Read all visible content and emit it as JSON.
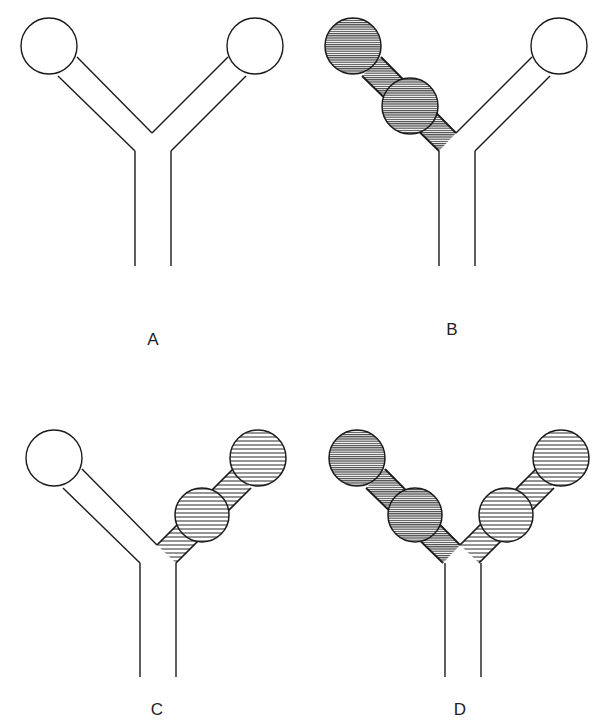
{
  "figure": {
    "colors": {
      "stroke": "#1a1a1a",
      "dense_hatch": "#3a3a3a",
      "sparse_hatch": "#2a2a2a",
      "background": "#ffffff"
    },
    "panels": [
      {
        "id": "A",
        "label": "A",
        "left_arm": "empty",
        "right_arm": "empty",
        "left_circles": 1,
        "right_circles": 1
      },
      {
        "id": "B",
        "label": "B",
        "left_arm": "dense-hatched",
        "right_arm": "empty",
        "left_circles": 2,
        "right_circles": 1
      },
      {
        "id": "C",
        "label": "C",
        "left_arm": "empty",
        "right_arm": "sparse-hatched",
        "left_circles": 1,
        "right_circles": 2
      },
      {
        "id": "D",
        "label": "D",
        "left_arm": "dense-hatched",
        "right_arm": "sparse-hatched",
        "left_circles": 2,
        "right_circles": 2
      }
    ]
  }
}
